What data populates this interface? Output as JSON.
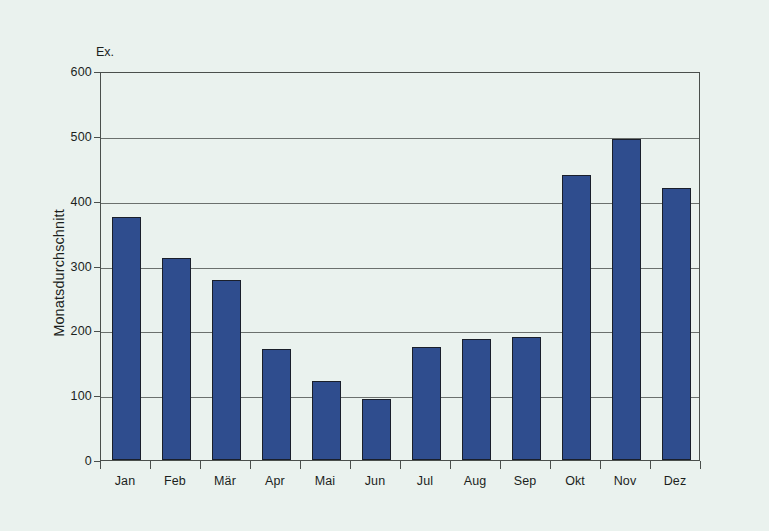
{
  "figure": {
    "top_caption": "",
    "background_color": "#eaf2ee",
    "frame_color": "#4a4f4c"
  },
  "axis": {
    "unit_label": "Ex.",
    "y_title": "Monatsdurchschnitt",
    "y_ticks": [
      "600",
      "500",
      "400",
      "300",
      "200",
      "100",
      "0"
    ]
  },
  "chart_data": {
    "type": "bar",
    "title": "",
    "xlabel": "",
    "ylabel": "Monatsdurchschnitt",
    "unit": "Ex.",
    "ylim": [
      0,
      600
    ],
    "ytick_step": 100,
    "grid": true,
    "legend": "none",
    "bar_color": "#2f4d8e",
    "categories": [
      "Jan",
      "Feb",
      "Mär",
      "Apr",
      "Mai",
      "Jun",
      "Jul",
      "Aug",
      "Sep",
      "Okt",
      "Nov",
      "Dez"
    ],
    "values": [
      375,
      311,
      277,
      171,
      122,
      94,
      174,
      186,
      190,
      440,
      495,
      420
    ]
  }
}
